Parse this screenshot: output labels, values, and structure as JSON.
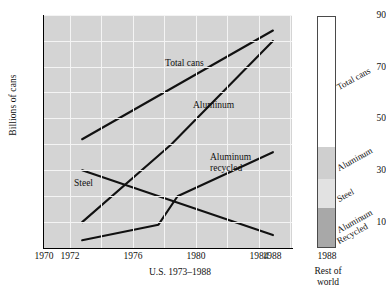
{
  "chart_data": {
    "type": "line",
    "title": "",
    "xlabel": "U.S. 1973–1988",
    "ylabel": "Billions of cans",
    "xlim": [
      1970,
      1989.5
    ],
    "ylim": [
      0,
      90
    ],
    "grid": true,
    "legend_position": "inline-annotations",
    "xticks": [
      "1970",
      "1972",
      "1976",
      "1980",
      "1984",
      "1988"
    ],
    "xtick_values": [
      1970,
      1972,
      1976,
      1980,
      1984,
      1988
    ],
    "yticks": [
      "10",
      "30",
      "50",
      "70",
      "90"
    ],
    "ytick_values": [
      10,
      30,
      50,
      70,
      90
    ],
    "series": [
      {
        "name": "Total cans",
        "x": [
          1973,
          1988
        ],
        "values": [
          42,
          84
        ],
        "label": "Total cans",
        "label_x": 165,
        "label_y": 58
      },
      {
        "name": "Aluminum",
        "x": [
          1973,
          1980,
          1988
        ],
        "values": [
          10,
          40,
          80
        ],
        "label": "Aluminum",
        "label_x": 193,
        "label_y": 100
      },
      {
        "name": "Steel",
        "x": [
          1973,
          1988
        ],
        "values": [
          30,
          5
        ],
        "label": "Steel",
        "label_x": 74,
        "label_y": 178
      },
      {
        "name": "Aluminum recycled",
        "x": [
          1973,
          1979,
          1980.5,
          1988
        ],
        "values": [
          3,
          9,
          20,
          37
        ],
        "label": "Aluminum\nrecycled",
        "label_line1": "Aluminum",
        "label_line2": "recycled",
        "label_x": 210,
        "label_y": 152
      }
    ],
    "stacked_bar": {
      "caption_line1": "Rest of",
      "caption_line2": "world",
      "tick_label": "1988",
      "segments": [
        {
          "name": "Total cans",
          "label": "Total cans",
          "color": "#ffffff",
          "top_pct": 0,
          "height_pct": 56.5
        },
        {
          "name": "Aluminum",
          "label": "Aluminum",
          "color": "#cfcfcf",
          "top_pct": 56.5,
          "height_pct": 13.8
        },
        {
          "name": "Steel",
          "label": "Steel",
          "color": "#e2e2e2",
          "top_pct": 70.3,
          "height_pct": 12.9
        },
        {
          "name": "Aluminum Recycled",
          "label_line1": "Aluminum",
          "label_line2": "Recycled",
          "label": "Aluminum Recycled",
          "color": "#a8a8a8",
          "top_pct": 83.2,
          "height_pct": 16.8
        }
      ]
    }
  },
  "colors": {
    "plot_background": "#d4d4d4",
    "gridline": "#f4f4f4",
    "line": "#111111",
    "axis": "#000000",
    "page_background": "#ffffff"
  }
}
